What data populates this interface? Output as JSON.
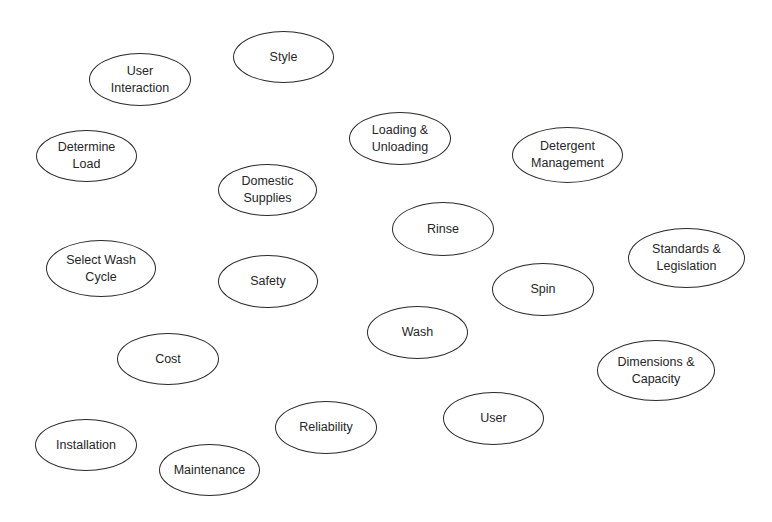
{
  "diagram": {
    "type": "bubble-diagram",
    "stroke_color": "#2a2a2a",
    "text_color": "#262626",
    "background": "#ffffff",
    "nodes": [
      {
        "id": "style",
        "lines": [
          "Style"
        ],
        "x": 233,
        "y": 31,
        "w": 101,
        "h": 52
      },
      {
        "id": "user-interaction",
        "lines": [
          "User",
          "Interaction"
        ],
        "x": 89,
        "y": 53,
        "w": 102,
        "h": 53
      },
      {
        "id": "determine-load",
        "lines": [
          "Determine",
          "Load"
        ],
        "x": 36,
        "y": 130,
        "w": 101,
        "h": 52
      },
      {
        "id": "loading-unloading",
        "lines": [
          "Loading &",
          "Unloading"
        ],
        "x": 349,
        "y": 112,
        "w": 102,
        "h": 53
      },
      {
        "id": "detergent-management",
        "lines": [
          "Detergent",
          "Management"
        ],
        "x": 512,
        "y": 127,
        "w": 111,
        "h": 56
      },
      {
        "id": "domestic-supplies",
        "lines": [
          "Domestic",
          "Supplies"
        ],
        "x": 218,
        "y": 164,
        "w": 99,
        "h": 52
      },
      {
        "id": "rinse",
        "lines": [
          "Rinse"
        ],
        "x": 392,
        "y": 202,
        "w": 102,
        "h": 54
      },
      {
        "id": "standards-legislation",
        "lines": [
          "Standards &",
          "Legislation"
        ],
        "x": 628,
        "y": 228,
        "w": 117,
        "h": 60
      },
      {
        "id": "select-wash-cycle",
        "lines": [
          "Select Wash",
          "Cycle"
        ],
        "x": 46,
        "y": 240,
        "w": 110,
        "h": 57
      },
      {
        "id": "safety",
        "lines": [
          "Safety"
        ],
        "x": 218,
        "y": 255,
        "w": 100,
        "h": 53
      },
      {
        "id": "spin",
        "lines": [
          "Spin"
        ],
        "x": 492,
        "y": 263,
        "w": 102,
        "h": 53
      },
      {
        "id": "wash",
        "lines": [
          "Wash"
        ],
        "x": 367,
        "y": 306,
        "w": 101,
        "h": 53
      },
      {
        "id": "cost",
        "lines": [
          "Cost"
        ],
        "x": 117,
        "y": 333,
        "w": 102,
        "h": 52
      },
      {
        "id": "dimensions-capacity",
        "lines": [
          "Dimensions &",
          "Capacity"
        ],
        "x": 597,
        "y": 340,
        "w": 118,
        "h": 61
      },
      {
        "id": "user",
        "lines": [
          "User"
        ],
        "x": 443,
        "y": 392,
        "w": 101,
        "h": 53
      },
      {
        "id": "reliability",
        "lines": [
          "Reliability"
        ],
        "x": 275,
        "y": 401,
        "w": 102,
        "h": 53
      },
      {
        "id": "installation",
        "lines": [
          "Installation"
        ],
        "x": 35,
        "y": 419,
        "w": 102,
        "h": 52
      },
      {
        "id": "maintenance",
        "lines": [
          "Maintenance"
        ],
        "x": 159,
        "y": 444,
        "w": 101,
        "h": 52
      }
    ]
  }
}
